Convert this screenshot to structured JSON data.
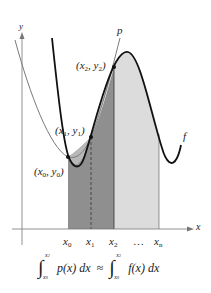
{
  "figure": {
    "axes": {
      "x_label": "x",
      "y_label": "y"
    },
    "curve_labels": {
      "p": "p",
      "f": "f"
    },
    "points": [
      {
        "label": "x",
        "sub": "0",
        "label2": "y",
        "sub2": "0",
        "text": "(x0, y0)"
      },
      {
        "label": "x",
        "sub": "1",
        "label2": "y",
        "sub2": "1",
        "text": "(x1, y1)"
      },
      {
        "label": "x",
        "sub": "2",
        "label2": "y",
        "sub2": "2",
        "text": "(x2, y2)"
      }
    ],
    "x_ticks": [
      {
        "base": "x",
        "sub": "0"
      },
      {
        "base": "x",
        "sub": "1"
      },
      {
        "base": "x",
        "sub": "2"
      },
      {
        "base": "…",
        "sub": ""
      },
      {
        "base": "x",
        "sub": "n"
      }
    ],
    "formula": {
      "lower": "x0",
      "lower_base": "x",
      "lower_sub": "0",
      "upper_base": "x",
      "upper_sub": "2",
      "left_integrand": "p(x) dx",
      "approx": "≈",
      "right_integrand": "f(x) dx"
    },
    "colors": {
      "dark_shade": "#8c8c8c",
      "mid_shade": "#b4b4b4",
      "light_shade": "#dcdcdc",
      "f_curve": "#111111",
      "p_curve": "#777777",
      "axis": "#666666"
    }
  }
}
